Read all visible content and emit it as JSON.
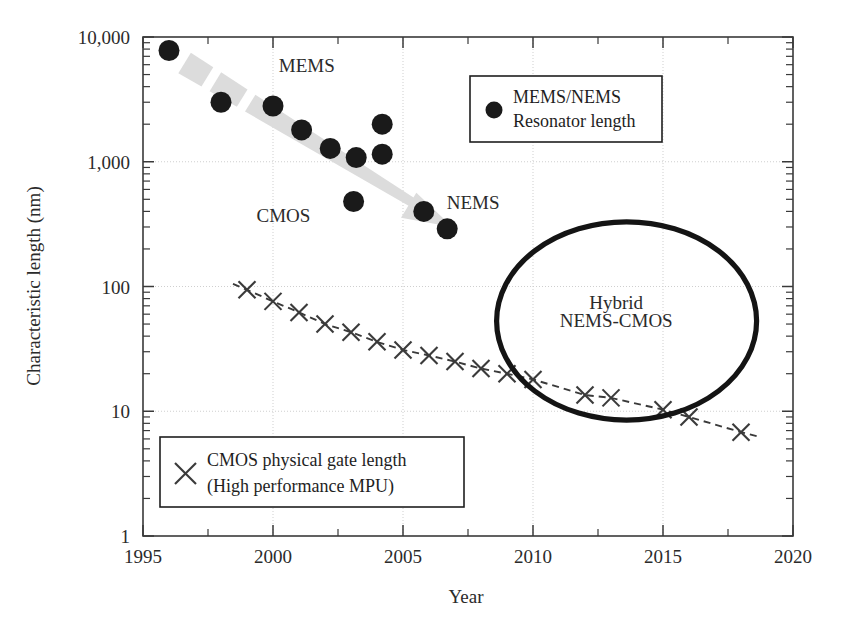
{
  "chart_data": {
    "type": "scatter",
    "title": "",
    "xlabel": "Year",
    "ylabel": "Characteristic length (nm)",
    "xlim": [
      1995,
      2020
    ],
    "ylim": [
      1,
      10000
    ],
    "yscale": "log",
    "grid": true,
    "xticks": [
      1995,
      2000,
      2005,
      2010,
      2015,
      2020
    ],
    "xtick_labels": [
      "1995",
      "2000",
      "2005",
      "2010",
      "2015",
      "2020"
    ],
    "yticks": [
      1,
      10,
      100,
      1000,
      10000
    ],
    "ytick_labels": [
      "1",
      "10",
      "100",
      "1,000",
      "10,000"
    ],
    "legend_position": "upper-right and lower-left",
    "series": [
      {
        "name": "MEMS/NEMS Resonator length",
        "marker": "filled-circle",
        "color": "#1a1a1a",
        "points": [
          {
            "x": 1996.0,
            "y": 7800
          },
          {
            "x": 1998.0,
            "y": 3000
          },
          {
            "x": 2000.0,
            "y": 2800
          },
          {
            "x": 2001.1,
            "y": 1800
          },
          {
            "x": 2002.2,
            "y": 1280
          },
          {
            "x": 2003.2,
            "y": 1080
          },
          {
            "x": 2003.1,
            "y": 480
          },
          {
            "x": 2004.2,
            "y": 2000
          },
          {
            "x": 2004.2,
            "y": 1150
          },
          {
            "x": 2005.8,
            "y": 400
          },
          {
            "x": 2006.7,
            "y": 290
          }
        ]
      },
      {
        "name": "CMOS physical gate length (High performance MPU)",
        "marker": "x",
        "color": "#3a3a3a",
        "linestyle": "dashed",
        "points": [
          {
            "x": 1999.0,
            "y": 94
          },
          {
            "x": 2000.0,
            "y": 76
          },
          {
            "x": 2001.0,
            "y": 62
          },
          {
            "x": 2002.0,
            "y": 50
          },
          {
            "x": 2003.0,
            "y": 43
          },
          {
            "x": 2004.0,
            "y": 36
          },
          {
            "x": 2005.0,
            "y": 31
          },
          {
            "x": 2006.0,
            "y": 28
          },
          {
            "x": 2007.0,
            "y": 25
          },
          {
            "x": 2008.0,
            "y": 22
          },
          {
            "x": 2009.0,
            "y": 20
          },
          {
            "x": 2010.0,
            "y": 18
          },
          {
            "x": 2012.0,
            "y": 13.5
          },
          {
            "x": 2013.0,
            "y": 12.8
          },
          {
            "x": 2015.0,
            "y": 10.3
          },
          {
            "x": 2016.0,
            "y": 9.0
          },
          {
            "x": 2018.0,
            "y": 6.8
          }
        ]
      }
    ],
    "annotations": [
      {
        "text": "MEMS",
        "x": 2001.3,
        "y": 5200
      },
      {
        "text": "NEMS",
        "x": 2007.7,
        "y": 420
      },
      {
        "text": "CMOS",
        "x": 2000.4,
        "y": 330
      },
      {
        "text": "Hybrid",
        "x": 2013.2,
        "y": 66
      },
      {
        "text": "NEMS-CMOS",
        "x": 2013.2,
        "y": 47
      }
    ],
    "trend_arrow": {
      "label": "MEMS to NEMS scaling arrow",
      "from": {
        "x": 1996.6,
        "y": 6200
      },
      "to": {
        "x": 2006.9,
        "y": 300
      },
      "color": "#dcdcdc"
    },
    "hybrid_region": {
      "label": "Hybrid NEMS-CMOS",
      "shape": "ellipse",
      "center": {
        "x": 2013.4,
        "y": 55
      },
      "x_span": [
        2008.6,
        2018.6
      ],
      "y_span": [
        8.5,
        330
      ]
    }
  },
  "legends": {
    "mems": {
      "marker_name": "filled-circle-marker",
      "line1": "MEMS/NEMS",
      "line2": "Resonator length"
    },
    "cmos": {
      "marker_name": "x-marker",
      "line1": "CMOS physical gate length",
      "line2": "(High performance MPU)"
    }
  },
  "axis": {
    "x_title": "Year",
    "y_title": "Characteristic length (nm)"
  }
}
